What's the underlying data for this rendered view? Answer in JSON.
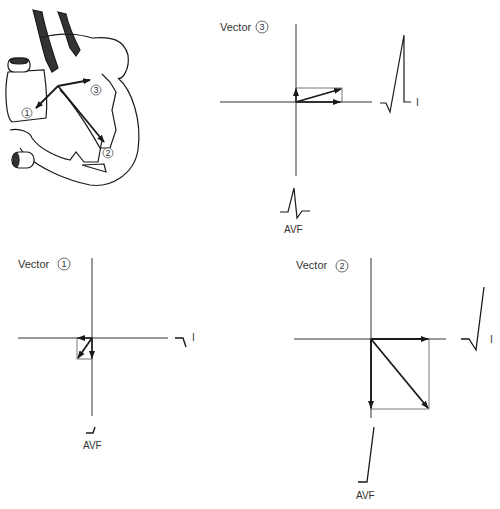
{
  "figure": {
    "heart": {
      "vectors": [
        {
          "id": "1",
          "label": "1"
        },
        {
          "id": "2",
          "label": "2"
        },
        {
          "id": "3",
          "label": "3"
        }
      ]
    },
    "panels": [
      {
        "id": "vector3",
        "title": "Vector",
        "number": "3",
        "lead_horizontal": "I",
        "lead_vertical": "AVF"
      },
      {
        "id": "vector1",
        "title": "Vector",
        "number": "1",
        "lead_horizontal": "I",
        "lead_vertical": "AVF"
      },
      {
        "id": "vector2",
        "title": "Vector",
        "number": "2",
        "lead_horizontal": "I",
        "lead_vertical": "AVF"
      }
    ]
  },
  "colors": {
    "stroke": "#1a1a1a",
    "thin": "#555555",
    "background": "#ffffff"
  }
}
